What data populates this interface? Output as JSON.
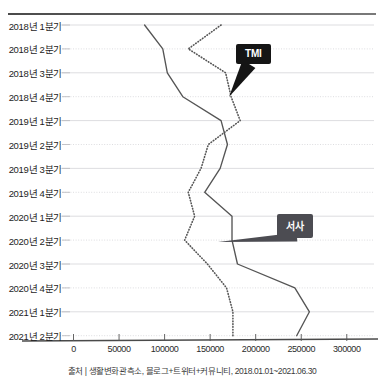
{
  "chart_data": {
    "type": "line",
    "orientation": "horizontal",
    "title": "",
    "xlabel": "",
    "ylabel": "",
    "grid": true,
    "legend_position": "annotated-callouts",
    "xlim": [
      0,
      320000
    ],
    "xticks": [
      0,
      50000,
      100000,
      150000,
      200000,
      250000,
      300000
    ],
    "xtick_labels": [
      "0",
      "50000",
      "100000",
      "150000",
      "200000",
      "250000",
      "300000"
    ],
    "categories": [
      "2018년 1분기",
      "2018년 2분기",
      "2018년 3분기",
      "2018년 4분기",
      "2019년 1분기",
      "2019년 2분기",
      "2019년 3분기",
      "2019년 4분기",
      "2020년 1분기",
      "2020년 2분기",
      "2020년 3분기",
      "2020년 4분기",
      "2021년 1분기",
      "2021년 2분기"
    ],
    "series": [
      {
        "name": "서사",
        "style": "solid",
        "color": "#555555",
        "values": [
          78000,
          98000,
          103000,
          120000,
          162000,
          169000,
          161000,
          144000,
          174000,
          174000,
          180000,
          243000,
          259000,
          245000
        ]
      },
      {
        "name": "TMI",
        "style": "dotted",
        "color": "#555555",
        "values": [
          162000,
          126000,
          167000,
          173000,
          183000,
          148000,
          140000,
          126000,
          133000,
          122000,
          147000,
          168000,
          175000,
          175000
        ]
      }
    ],
    "annotations": [
      {
        "label": "TMI",
        "target_category": "2018년 4분기",
        "style": "black"
      },
      {
        "label": "서사",
        "target_category": "2020년 2분기",
        "style": "grey"
      }
    ]
  },
  "footer": {
    "source": "출처 | 생활변화관측소, 블로그+트위터+커뮤니티, 2018.01.01~2021.06.30"
  }
}
